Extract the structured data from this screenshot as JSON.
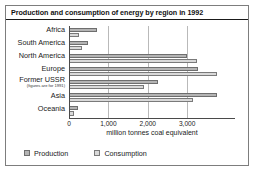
{
  "chart_data": {
    "type": "bar",
    "orientation": "horizontal",
    "title": "Production and consumption of energy by region in 1992",
    "xlabel": "million tonnes coal equivalent",
    "ylabel": "",
    "xlim": [
      0,
      4200
    ],
    "xticks": [
      0,
      1000,
      2000,
      3000
    ],
    "xtick_labels": [
      "0",
      "1,000",
      "2,000",
      "3,000"
    ],
    "grid": true,
    "legend_position": "bottom-left",
    "categories": [
      "Africa",
      "South America",
      "North America",
      "Europe",
      "Former USSR",
      "Asia",
      "Oceania"
    ],
    "category_notes": {
      "Former USSR": "(figures are for 1991)"
    },
    "series": [
      {
        "name": "Production",
        "color": "#b4b4b4",
        "values": [
          700,
          480,
          3000,
          3280,
          2250,
          3750,
          230
        ]
      },
      {
        "name": "Consumption",
        "color": "#d9d9d9",
        "values": [
          250,
          330,
          3250,
          3750,
          1900,
          3150,
          130
        ]
      }
    ]
  },
  "legend": {
    "items": [
      {
        "label": "Production"
      },
      {
        "label": "Consumption"
      }
    ]
  }
}
